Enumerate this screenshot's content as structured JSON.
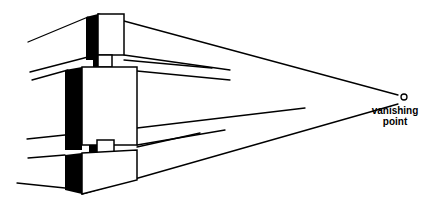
{
  "diagram": {
    "label_line1": "vanishing",
    "label_line2": "point",
    "vanishing_point": {
      "x": 404,
      "y": 97
    },
    "colors": {
      "ink": "#000000",
      "paper": "#ffffff"
    }
  }
}
